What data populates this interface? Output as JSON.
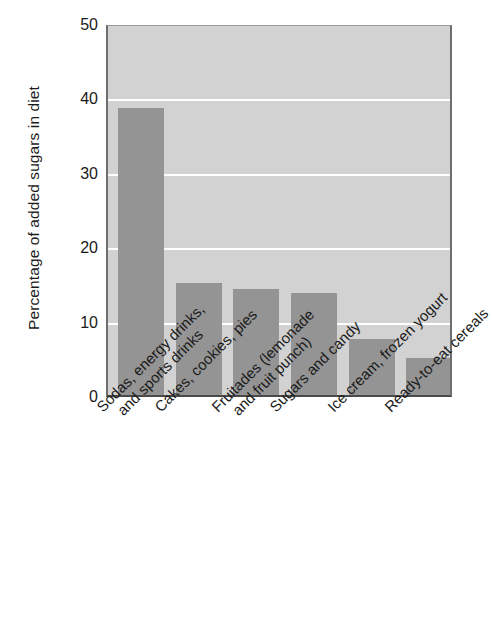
{
  "chart_data": {
    "type": "bar",
    "title": "",
    "subtitle": "",
    "xlabel": "",
    "ylabel": "Percentage of added sugars in diet",
    "ylim": [
      0,
      50
    ],
    "yticks": [
      0,
      10,
      20,
      30,
      40,
      50
    ],
    "ytick_labels": [
      "0",
      "10",
      "20",
      "30",
      "40",
      "50"
    ],
    "grid": true,
    "gridline_color": "#ffffff",
    "legend": null,
    "legend_position": "none",
    "bar_color": "#949494",
    "plot_background_color": "#d2d2d2",
    "figure_background_color": "#ffffff",
    "axis_color": "#4a4a4a",
    "categories": [
      "Sodas, energy drinks, and sports drinks",
      "Cakes, cookies, pies",
      "Fruitades (lemonade and fruit punch)",
      "Sugars and candy",
      "Ice cream, frozen yogurt",
      "Ready-to-eat cereals"
    ],
    "category_lines": [
      [
        "Sodas, energy drinks,",
        "and sports drinks"
      ],
      [
        "Cakes, cookies, pies",
        ""
      ],
      [
        "Fruitades (lemonade",
        "and fruit punch)"
      ],
      [
        "Sugars and candy",
        ""
      ],
      [
        "Ice cream, frozen yogurt",
        ""
      ],
      [
        "Ready-to-eat cereals",
        ""
      ]
    ],
    "values": [
      38.6,
      15.0,
      14.3,
      13.7,
      7.5,
      5.0
    ]
  }
}
